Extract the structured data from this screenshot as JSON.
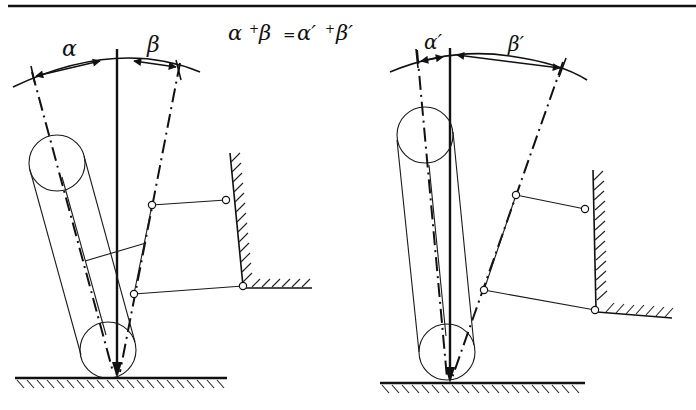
{
  "figure": {
    "type": "technical-diagram",
    "equation": {
      "lhs_a": "α",
      "plus1": "+",
      "lhs_b": "β",
      "equals": "=",
      "rhs_a": "α′",
      "plus2": "+",
      "rhs_b": "β′"
    },
    "left_panel": {
      "angle_label_1": "α",
      "angle_label_2": "β"
    },
    "right_panel": {
      "angle_label_1": "α′",
      "angle_label_2": "β′"
    },
    "colors": {
      "line": "#111111",
      "background": "#ffffff"
    }
  }
}
